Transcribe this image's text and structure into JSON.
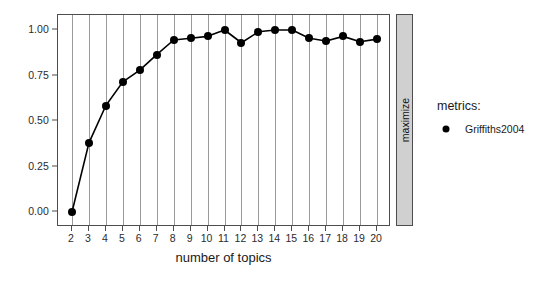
{
  "chart_data": {
    "type": "line",
    "title": "",
    "subtitle": "",
    "xlabel": "number of topics",
    "ylabel": "",
    "x": [
      2,
      3,
      4,
      5,
      6,
      7,
      8,
      9,
      10,
      11,
      12,
      13,
      14,
      15,
      16,
      17,
      18,
      19,
      20
    ],
    "series": [
      {
        "name": "Griffiths2004",
        "values": [
          0.0,
          0.38,
          0.585,
          0.715,
          0.78,
          0.865,
          0.945,
          0.955,
          0.965,
          1.0,
          0.93,
          0.99,
          1.0,
          1.0,
          0.955,
          0.94,
          0.965,
          0.935,
          0.95
        ]
      }
    ],
    "xlim": [
      2,
      20
    ],
    "ylim": [
      0.0,
      1.0
    ],
    "xticks": [
      "2",
      "3",
      "4",
      "5",
      "6",
      "7",
      "8",
      "9",
      "10",
      "11",
      "12",
      "13",
      "14",
      "15",
      "16",
      "17",
      "18",
      "19",
      "20"
    ],
    "yticks": [
      "0.00",
      "0.25",
      "0.50",
      "0.75",
      "1.00"
    ],
    "ytick_values": [
      0.0,
      0.25,
      0.5,
      0.75,
      1.0
    ],
    "grid": "vertical-major-only",
    "legend_position": "right",
    "facet_strip_label": "maximize",
    "colors": {
      "point": "#000000",
      "line": "#000000",
      "gridline": "#9a9a9a",
      "panel_border": "#4d4d4d",
      "strip_background": "#d0d0d0",
      "background": "#ffffff"
    }
  },
  "legend": {
    "title": "metrics:",
    "entries": [
      {
        "label": "Griffiths2004",
        "marker": "circle-marker",
        "color": "#000000"
      }
    ]
  },
  "strip": {
    "label": "maximize"
  },
  "axes": {
    "x_title": "number of topics",
    "y_title": ""
  }
}
